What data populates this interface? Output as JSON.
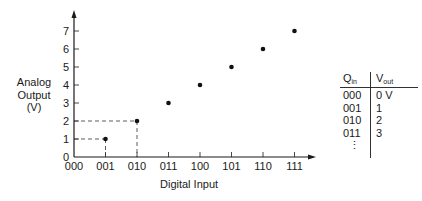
{
  "chart_data": {
    "type": "scatter",
    "title": "",
    "xlabel": "Digital Input",
    "ylabel": "Analog Output (V)",
    "categories": [
      "000",
      "001",
      "010",
      "011",
      "100",
      "101",
      "110",
      "111"
    ],
    "values": [
      0,
      1,
      2,
      3,
      4,
      5,
      6,
      7
    ],
    "y_ticks": [
      "0",
      "1",
      "2",
      "3",
      "4",
      "5",
      "6",
      "7"
    ],
    "ylim": [
      0,
      7
    ],
    "grid": false,
    "annotations": [
      "dashed guide lines from 001 to 1 V and from 010 to 2 V"
    ]
  },
  "labels": {
    "ylabel_line1": "Analog",
    "ylabel_line2": "Output",
    "ylabel_line3": "(V)",
    "xlabel": "Digital Input"
  },
  "table": {
    "col1_header": "Q",
    "col1_sub": "in",
    "col2_header": "V",
    "col2_sub": "out",
    "rows": [
      {
        "q": "000",
        "v": "0 V"
      },
      {
        "q": "001",
        "v": "1"
      },
      {
        "q": "010",
        "v": "2"
      },
      {
        "q": "011",
        "v": "3"
      }
    ],
    "continuation": "⋮"
  }
}
